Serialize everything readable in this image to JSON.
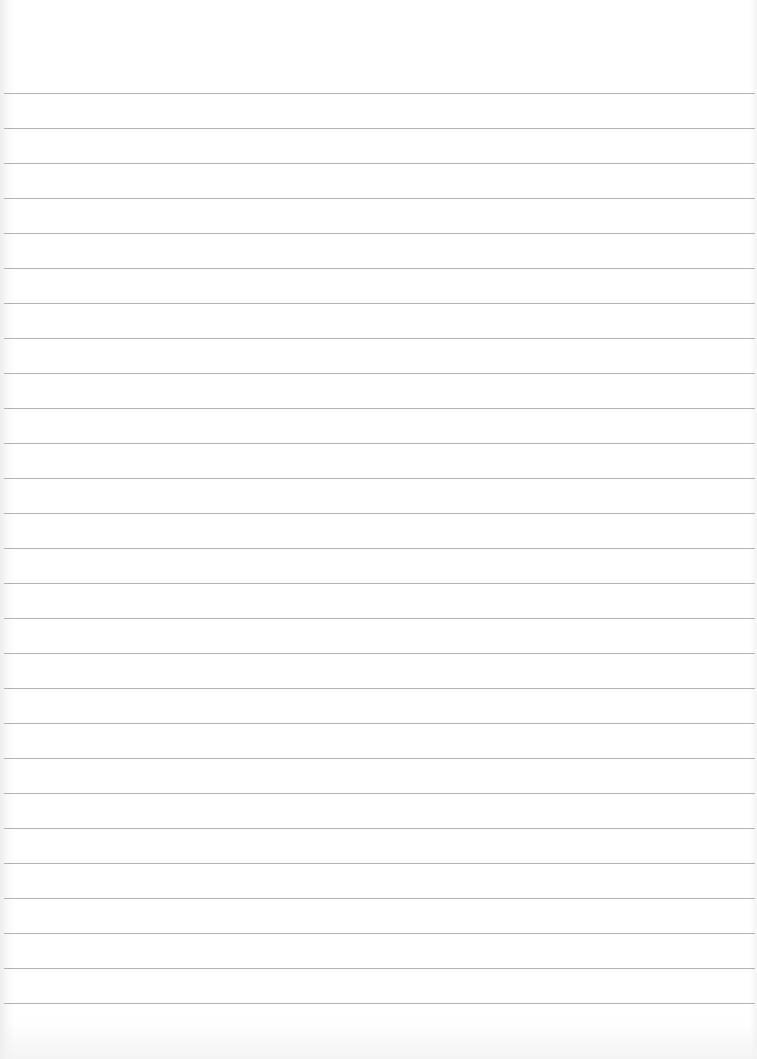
{
  "page": {
    "type": "lined-paper",
    "background_color": "#ffffff",
    "line_color": "#9a9a9a",
    "first_line_y": 93,
    "line_spacing": 35,
    "line_count": 27
  }
}
